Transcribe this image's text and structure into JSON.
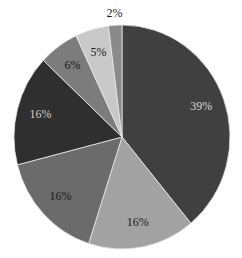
{
  "chart_data": {
    "type": "pie",
    "title": "",
    "start_angle": "12 o'clock",
    "direction": "clockwise",
    "legend": "none",
    "slices": [
      {
        "label": "39%",
        "value": 39,
        "color": "#404040",
        "text_color": "#d8d8d8"
      },
      {
        "label": "16%",
        "value": 16,
        "color": "#a2a2a2",
        "text_color": "#1a1a1a"
      },
      {
        "label": "16%",
        "value": 16,
        "color": "#6b6b6b",
        "text_color": "#1a1a1a"
      },
      {
        "label": "16%",
        "value": 16,
        "color": "#2f2f2f",
        "text_color": "#d0d0d0"
      },
      {
        "label": "6%",
        "value": 6,
        "color": "#7c7c7c",
        "text_color": "#1a1a1a"
      },
      {
        "label": "5%",
        "value": 5,
        "color": "#c9c9c9",
        "text_color": "#1a1a1a"
      },
      {
        "label": "2%",
        "value": 2,
        "color": "#8a8a8a",
        "text_color": "#1a1a1a",
        "label_outside": true
      }
    ]
  }
}
